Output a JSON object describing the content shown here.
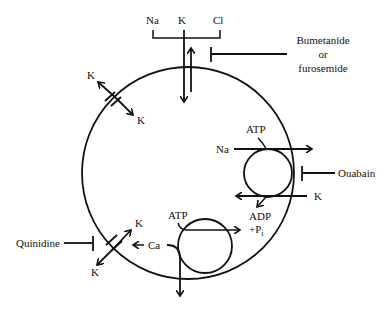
{
  "diagram": {
    "type": "cell-membrane-ion-transport",
    "colors": {
      "stroke": "#111111",
      "background": "#ffffff"
    },
    "cotransporter": {
      "ions": [
        "Na",
        "K",
        "Cl"
      ],
      "inhibitor": [
        "Bumetanide",
        "or",
        "furosemide"
      ]
    },
    "k_channel_top": {
      "outside": "K",
      "inside": "K"
    },
    "na_k_pump": {
      "atp": "ATP",
      "na": "Na",
      "k": "K",
      "adp": "ADP",
      "pi": "+P",
      "pi_sub": "i",
      "inhibitor": "Ouabain"
    },
    "ca_pump": {
      "atp": "ATP",
      "ca": "Ca"
    },
    "k_channel_bottom": {
      "inside": "K",
      "outside": "K",
      "inhibitor": "Quinidine"
    }
  }
}
